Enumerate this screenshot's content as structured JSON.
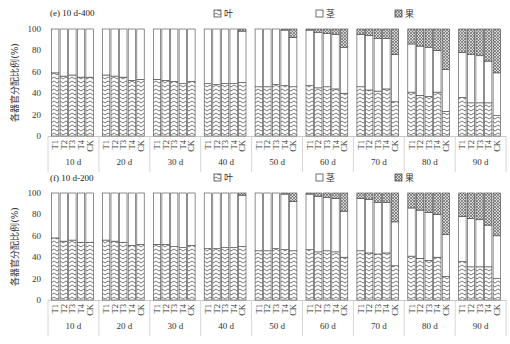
{
  "chart_data": [
    {
      "type": "bar",
      "stacked": true,
      "title": "(e) 10 d-400",
      "ylabel": "各器官分配比例(%)",
      "xlabel": "",
      "ylim": [
        0,
        100
      ],
      "yticks": [
        "0",
        "20",
        "40",
        "60",
        "80",
        "100"
      ],
      "groups": [
        "10 d",
        "20 d",
        "30 d",
        "40 d",
        "50 d",
        "60 d",
        "70 d",
        "80 d",
        "90 d"
      ],
      "categories": [
        "T1",
        "T2",
        "T3",
        "T4",
        "CK"
      ],
      "legend": [
        "叶",
        "茎",
        "果"
      ],
      "legend_position": "top",
      "series": [
        {
          "name": "叶",
          "pattern": "chevron",
          "values": [
            [
              59,
              56,
              57,
              55,
              55
            ],
            [
              57,
              56,
              55,
              52,
              53
            ],
            [
              53,
              52,
              51,
              49,
              51
            ],
            [
              49,
              48,
              49,
              49,
              50
            ],
            [
              46,
              46,
              48,
              47,
              46
            ],
            [
              47,
              45,
              46,
              44,
              40
            ],
            [
              46,
              43,
              42,
              44,
              32
            ],
            [
              41,
              38,
              37,
              41,
              23
            ],
            [
              36,
              31,
              31,
              31,
              19
            ]
          ]
        },
        {
          "name": "茎",
          "pattern": "blank",
          "values": [
            [
              41,
              44,
              43,
              45,
              45
            ],
            [
              43,
              44,
              45,
              48,
              47
            ],
            [
              47,
              48,
              49,
              51,
              49
            ],
            [
              51,
              52,
              51,
              51,
              48
            ],
            [
              54,
              54,
              52,
              52,
              46
            ],
            [
              52,
              52,
              50,
              51,
              43
            ],
            [
              49,
              51,
              49,
              47,
              44
            ],
            [
              45,
              46,
              46,
              39,
              39
            ],
            [
              42,
              45,
              44,
              39,
              40
            ]
          ]
        },
        {
          "name": "果",
          "pattern": "crosshatch",
          "values": [
            [
              0,
              0,
              0,
              0,
              0
            ],
            [
              0,
              0,
              0,
              0,
              0
            ],
            [
              0,
              0,
              0,
              0,
              0
            ],
            [
              0,
              0,
              0,
              0,
              2
            ],
            [
              0,
              0,
              0,
              1,
              8
            ],
            [
              1,
              3,
              4,
              5,
              17
            ],
            [
              5,
              6,
              9,
              9,
              24
            ],
            [
              14,
              16,
              17,
              20,
              38
            ],
            [
              22,
              24,
              25,
              30,
              41
            ]
          ]
        }
      ]
    },
    {
      "type": "bar",
      "stacked": true,
      "title": "(f) 10 d-200",
      "ylabel": "各器官分配比例(%)",
      "xlabel": "",
      "ylim": [
        0,
        100
      ],
      "yticks": [
        "0",
        "20",
        "40",
        "60",
        "80",
        "100"
      ],
      "groups": [
        "10 d",
        "20 d",
        "30 d",
        "40 d",
        "50 d",
        "60 d",
        "70 d",
        "80 d",
        "90 d"
      ],
      "categories": [
        "T1",
        "T2",
        "T3",
        "T4",
        "CK"
      ],
      "legend": [
        "叶",
        "茎",
        "果"
      ],
      "legend_position": "top",
      "series": [
        {
          "name": "叶",
          "pattern": "chevron",
          "values": [
            [
              58,
              55,
              56,
              54,
              54
            ],
            [
              56,
              55,
              54,
              51,
              52
            ],
            [
              52,
              52,
              50,
              49,
              51
            ],
            [
              48,
              48,
              49,
              49,
              50
            ],
            [
              46,
              46,
              48,
              47,
              46
            ],
            [
              47,
              45,
              46,
              45,
              40
            ],
            [
              46,
              44,
              43,
              44,
              32
            ],
            [
              41,
              39,
              37,
              40,
              22
            ],
            [
              36,
              31,
              31,
              31,
              20
            ]
          ]
        },
        {
          "name": "茎",
          "pattern": "blank",
          "values": [
            [
              42,
              45,
              44,
              46,
              46
            ],
            [
              44,
              45,
              46,
              49,
              48
            ],
            [
              48,
              48,
              50,
              51,
              49
            ],
            [
              52,
              52,
              51,
              51,
              48
            ],
            [
              54,
              54,
              52,
              52,
              46
            ],
            [
              52,
              52,
              50,
              50,
              43
            ],
            [
              49,
              50,
              48,
              47,
              41
            ],
            [
              45,
              45,
              45,
              40,
              39
            ],
            [
              42,
              45,
              44,
              39,
              40
            ]
          ]
        },
        {
          "name": "果",
          "pattern": "crosshatch",
          "values": [
            [
              0,
              0,
              0,
              0,
              0
            ],
            [
              0,
              0,
              0,
              0,
              0
            ],
            [
              0,
              0,
              0,
              0,
              0
            ],
            [
              0,
              0,
              0,
              0,
              2
            ],
            [
              0,
              0,
              0,
              1,
              8
            ],
            [
              1,
              3,
              4,
              5,
              17
            ],
            [
              5,
              6,
              9,
              9,
              27
            ],
            [
              14,
              16,
              18,
              20,
              39
            ],
            [
              22,
              24,
              25,
              30,
              40
            ]
          ]
        }
      ]
    }
  ]
}
